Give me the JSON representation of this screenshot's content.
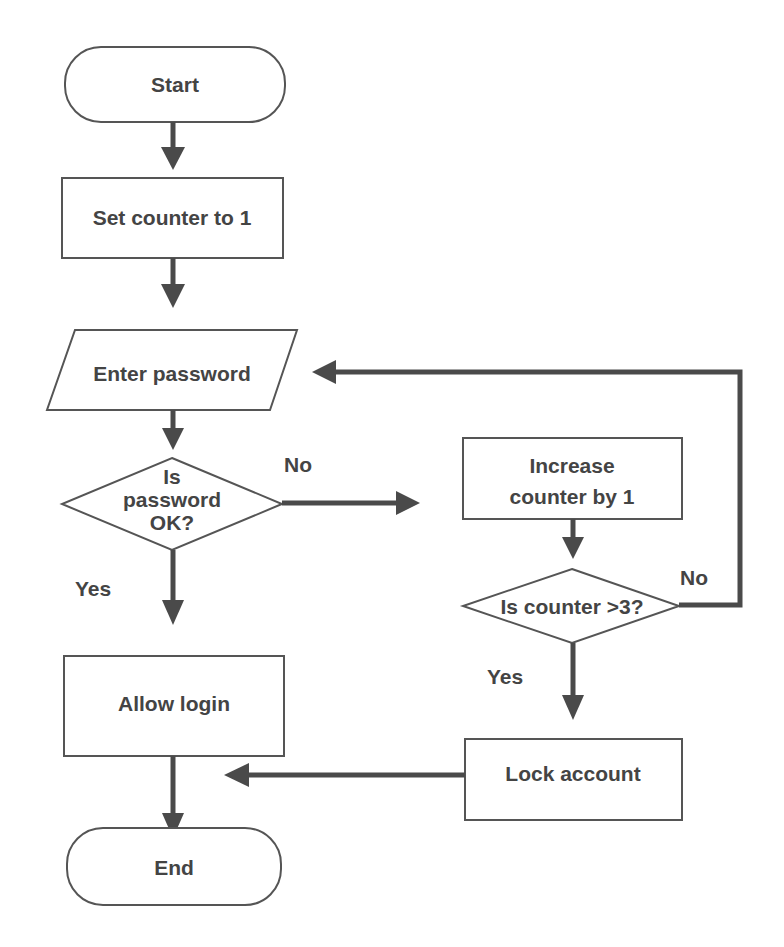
{
  "diagram": {
    "type": "flowchart",
    "colors": {
      "stroke": "#555555",
      "arrow": "#4a4a4a",
      "text": "#444444",
      "background": "#ffffff"
    },
    "nodes": {
      "start": {
        "shape": "terminator",
        "label": "Start"
      },
      "set_counter": {
        "shape": "process",
        "label": "Set counter to 1"
      },
      "enter_password": {
        "shape": "input-output",
        "label": "Enter password"
      },
      "password_ok": {
        "shape": "decision",
        "lines": [
          "Is",
          "password",
          "OK?"
        ]
      },
      "increase_counter": {
        "shape": "process",
        "lines": [
          "Increase",
          "counter by 1"
        ]
      },
      "counter_check": {
        "shape": "decision",
        "label": "Is counter >3?"
      },
      "allow_login": {
        "shape": "process",
        "label": "Allow login"
      },
      "lock_account": {
        "shape": "process",
        "label": "Lock account"
      },
      "end": {
        "shape": "terminator",
        "label": "End"
      }
    },
    "edge_labels": {
      "password_no": "No",
      "password_yes": "Yes",
      "counter_no": "No",
      "counter_yes": "Yes"
    },
    "edges": [
      {
        "from": "start",
        "to": "set_counter"
      },
      {
        "from": "set_counter",
        "to": "enter_password"
      },
      {
        "from": "enter_password",
        "to": "password_ok"
      },
      {
        "from": "password_ok",
        "to": "increase_counter",
        "label": "No"
      },
      {
        "from": "password_ok",
        "to": "allow_login",
        "label": "Yes"
      },
      {
        "from": "increase_counter",
        "to": "counter_check"
      },
      {
        "from": "counter_check",
        "to": "enter_password",
        "label": "No"
      },
      {
        "from": "counter_check",
        "to": "lock_account",
        "label": "Yes"
      },
      {
        "from": "allow_login",
        "to": "end"
      },
      {
        "from": "lock_account",
        "to": "end"
      }
    ]
  }
}
